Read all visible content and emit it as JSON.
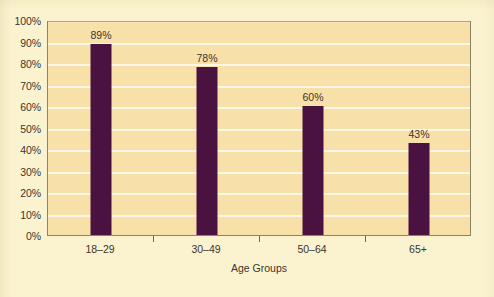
{
  "chart_data": {
    "type": "bar",
    "title": "",
    "subtitle": "",
    "xlabel": "Age Groups",
    "ylabel": "",
    "categories": [
      "18–29",
      "30–49",
      "50–64",
      "65+"
    ],
    "values": [
      89,
      78,
      60,
      43
    ],
    "data_labels": [
      "89%",
      "78%",
      "60%",
      "43%"
    ],
    "ylim": [
      0,
      100
    ],
    "ytick_labels": [
      "100%",
      "90%",
      "80%",
      "70%",
      "60%",
      "50%",
      "40%",
      "30%",
      "20%",
      "10%",
      "0%"
    ],
    "ytick_values": [
      100,
      90,
      80,
      70,
      60,
      50,
      40,
      30,
      20,
      10,
      0
    ],
    "grid": true,
    "legend": null,
    "legend_position": "none",
    "series": [
      {
        "name": "Percent",
        "values": [
          89,
          78,
          60,
          43
        ],
        "color": "#4a1240"
      }
    ]
  },
  "colors": {
    "page_background": "#fbf3cf",
    "plot_background": "#f7e1a9",
    "bar": "#4a1240",
    "gridline": "#ffffff",
    "plot_border": "#8d8560",
    "text": "#3a352c"
  },
  "footer": {
    "source_note": ""
  }
}
